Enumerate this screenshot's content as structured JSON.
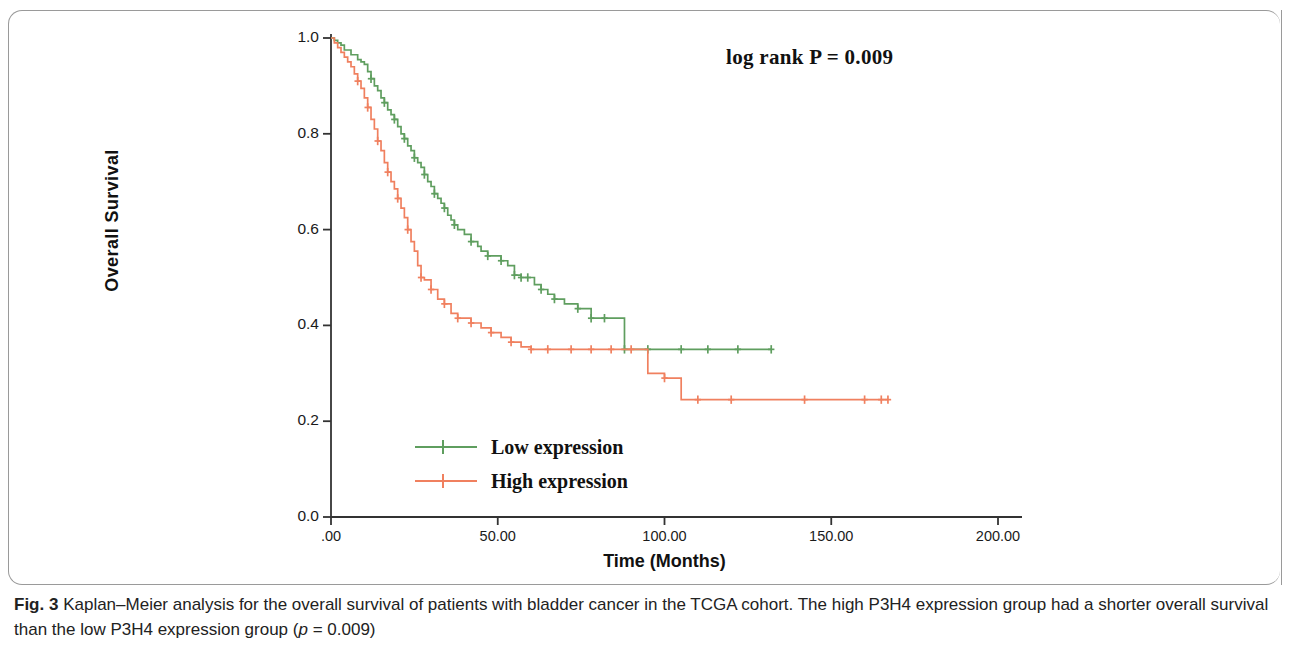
{
  "figure": {
    "annotation": "log rank P = 0.009",
    "caption_label": "Fig. 3",
    "caption_text_1": " Kaplan–Meier analysis for the overall survival of patients with bladder cancer in the TCGA cohort. The high P3H4 expression group had a shorter overall survival than the low P3H4 expression group (",
    "caption_italic": "p",
    "caption_text_2": " = 0.009)"
  },
  "colors": {
    "low_expression": "#5f9e5f",
    "high_expression": "#f0805f",
    "axis": "#333333"
  },
  "chart_data": {
    "type": "line",
    "title": "",
    "subtitle": "",
    "xlabel": "Time (Months)",
    "ylabel": "Overall Survival",
    "xlim": [
      0,
      200
    ],
    "ylim": [
      0,
      1.0
    ],
    "xticks": [
      0,
      50,
      100,
      150,
      200
    ],
    "xtick_labels": [
      ".00",
      "50.00",
      "100.00",
      "150.00",
      "200.00"
    ],
    "yticks": [
      0.0,
      0.2,
      0.4,
      0.6,
      0.8,
      1.0
    ],
    "ytick_labels": [
      "0.0",
      "0.2",
      "0.4",
      "0.6",
      "0.8",
      "1.0"
    ],
    "grid": false,
    "legend_position": "inside-lower-left",
    "annotations": [
      {
        "text": "log rank P = 0.009",
        "x": 130,
        "y": 0.955
      }
    ],
    "series": [
      {
        "name": "Low expression",
        "color": "#5f9e5f",
        "censor_marker": "plus",
        "x": [
          0,
          1,
          2,
          3,
          4,
          6,
          8,
          9,
          10,
          11,
          12,
          13,
          14,
          15,
          16,
          17,
          18,
          19,
          20,
          21,
          22,
          23,
          24,
          25,
          26,
          27,
          28,
          29,
          30,
          31,
          32,
          33,
          34,
          35,
          36,
          37,
          38,
          40,
          42,
          44,
          45,
          47,
          49,
          51,
          53,
          55,
          57,
          59,
          61,
          63,
          65,
          67,
          70,
          74,
          78,
          82,
          88,
          88,
          95,
          105,
          113,
          122,
          132
        ],
        "y": [
          1.0,
          0.995,
          0.99,
          0.985,
          0.975,
          0.965,
          0.955,
          0.95,
          0.945,
          0.93,
          0.915,
          0.9,
          0.89,
          0.875,
          0.865,
          0.85,
          0.84,
          0.83,
          0.815,
          0.8,
          0.79,
          0.775,
          0.765,
          0.75,
          0.74,
          0.73,
          0.715,
          0.7,
          0.69,
          0.675,
          0.665,
          0.655,
          0.645,
          0.63,
          0.62,
          0.61,
          0.6,
          0.59,
          0.575,
          0.565,
          0.555,
          0.545,
          0.545,
          0.535,
          0.525,
          0.505,
          0.5,
          0.5,
          0.485,
          0.475,
          0.465,
          0.455,
          0.445,
          0.435,
          0.415,
          0.415,
          0.415,
          0.35,
          0.35,
          0.35,
          0.35,
          0.35,
          0.35
        ],
        "censored_x": [
          12,
          16,
          19,
          22,
          25,
          28,
          31,
          34,
          37,
          42,
          47,
          51,
          55,
          57,
          59,
          63,
          67,
          74,
          78,
          82,
          88,
          95,
          105,
          113,
          122,
          132
        ],
        "final_survival": 0.35,
        "max_followup": 132
      },
      {
        "name": "High expression",
        "color": "#f0805f",
        "censor_marker": "plus",
        "x": [
          0,
          1,
          2,
          3,
          4,
          5,
          6,
          7,
          8,
          9,
          10,
          11,
          12,
          13,
          14,
          15,
          16,
          17,
          18,
          19,
          20,
          21,
          22,
          23,
          24,
          25,
          26,
          27,
          28,
          30,
          32,
          34,
          36,
          38,
          40,
          42,
          45,
          48,
          51,
          54,
          57,
          60,
          63,
          65,
          68,
          72,
          78,
          84,
          90,
          95,
          95,
          100,
          105,
          105,
          120,
          142,
          160,
          167
        ],
        "y": [
          1.0,
          0.99,
          0.98,
          0.97,
          0.96,
          0.95,
          0.94,
          0.925,
          0.91,
          0.895,
          0.875,
          0.855,
          0.83,
          0.81,
          0.785,
          0.765,
          0.74,
          0.72,
          0.7,
          0.685,
          0.665,
          0.645,
          0.625,
          0.6,
          0.575,
          0.555,
          0.525,
          0.5,
          0.495,
          0.475,
          0.455,
          0.445,
          0.425,
          0.415,
          0.415,
          0.405,
          0.395,
          0.385,
          0.375,
          0.365,
          0.355,
          0.35,
          0.35,
          0.35,
          0.35,
          0.35,
          0.35,
          0.35,
          0.35,
          0.35,
          0.3,
          0.29,
          0.29,
          0.245,
          0.245,
          0.245,
          0.245,
          0.245
        ],
        "censored_x": [
          8,
          11,
          14,
          17,
          20,
          23,
          27,
          30,
          34,
          38,
          42,
          48,
          54,
          60,
          65,
          72,
          78,
          84,
          90,
          100,
          110,
          120,
          142,
          160,
          165,
          167
        ],
        "final_survival": 0.245,
        "max_followup": 167
      }
    ],
    "legend": [
      {
        "label": "Low expression",
        "color": "#5f9e5f"
      },
      {
        "label": "High expression",
        "color": "#f0805f"
      }
    ]
  }
}
